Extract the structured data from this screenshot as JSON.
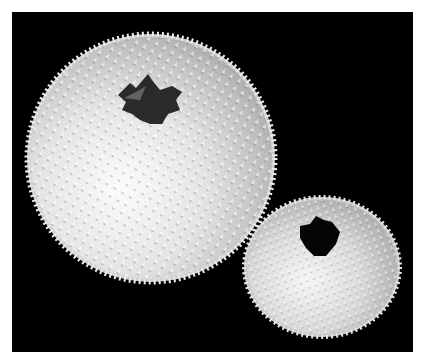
{
  "image": {
    "description": "Two white spiky spheres (pollen-grain-like) with dark openings on a black background",
    "background_color": "#000000",
    "border_color": "#ffffff",
    "subjects": [
      {
        "name": "large-spiky-sphere",
        "center": [
          151,
          158
        ],
        "radius": 121,
        "opening_center": [
          150,
          100
        ]
      },
      {
        "name": "small-spiky-sphere",
        "center": [
          322,
          266
        ],
        "radius": [
          75,
          68
        ],
        "opening_center": [
          322,
          240
        ]
      }
    ]
  }
}
